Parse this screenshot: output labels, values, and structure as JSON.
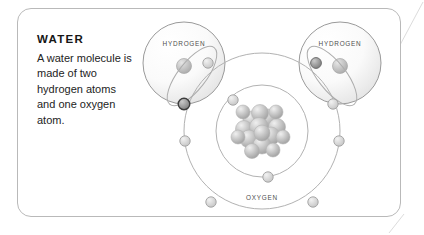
{
  "card": {
    "border_color": "#b9b9b9",
    "background": "#ffffff"
  },
  "caption": {
    "title": "WATER",
    "body": "A water molecule is made of two hydrogen atoms and one oxygen atom."
  },
  "diagram": {
    "labels": {
      "hydrogen_left": "HYDROGEN",
      "hydrogen_right": "HYDROGEN",
      "oxygen": "OXYGEN"
    },
    "colors": {
      "outline": "#9a9a9a",
      "orbit": "#b0b0b0",
      "electron_fill": "#d8d8d8",
      "electron_stroke": "#9c9c9c",
      "shared_electron_fill": "#8e8e8e",
      "shared_electron_stroke": "#3d3d3d",
      "nucleon_light": "#e8e8e8",
      "nucleon_dark": "#9d9d9d",
      "label_text": "#4e4e4e"
    },
    "atoms": [
      {
        "name": "hydrogen-left",
        "cx": 184,
        "cy": 63,
        "r": 41,
        "electron_count": 1
      },
      {
        "name": "hydrogen-right",
        "cx": 340,
        "cy": 63,
        "r": 41,
        "electron_count": 1
      },
      {
        "name": "oxygen",
        "cx": 262,
        "cy": 131,
        "nucleon_count": 16,
        "shells": [
          2,
          6
        ]
      }
    ]
  }
}
